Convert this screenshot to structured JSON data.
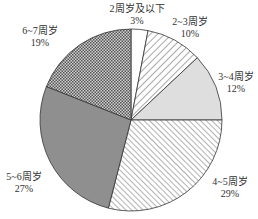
{
  "chart_data": {
    "type": "pie",
    "title": "",
    "start_angle": "12 o'clock",
    "direction": "clockwise",
    "categories": [
      "2周岁及以下",
      "2~3周岁",
      "3~4周岁",
      "4~5周岁",
      "5~6周岁",
      "6~7周岁"
    ],
    "values": [
      3,
      10,
      12,
      29,
      27,
      19
    ],
    "unit": "%",
    "slices": [
      {
        "label": "2周岁及以下",
        "value": 3,
        "value_label": "3%",
        "fill": "white",
        "color": "#ffffff"
      },
      {
        "label": "2~3周岁",
        "value": 10,
        "value_label": "10%",
        "fill": "diagonal-hatch",
        "color": "#ffffff"
      },
      {
        "label": "3~4周岁",
        "value": 12,
        "value_label": "12%",
        "fill": "light-gray",
        "color": "#dcdcdc"
      },
      {
        "label": "4~5周岁",
        "value": 29,
        "value_label": "29%",
        "fill": "back-diagonal-hatch",
        "color": "#ffffff"
      },
      {
        "label": "5~6周岁",
        "value": 27,
        "value_label": "27%",
        "fill": "dark-gray",
        "color": "#8e8e8e"
      },
      {
        "label": "6~7周岁",
        "value": 19,
        "value_label": "19%",
        "fill": "checker",
        "color": "#9a9a9a"
      }
    ],
    "legend": "none (labels placed outside slices)"
  },
  "labels": [
    {
      "name": "2周岁及以下",
      "pct": "3%"
    },
    {
      "name": "2~3周岁",
      "pct": "10%"
    },
    {
      "name": "3~4周岁",
      "pct": "12%"
    },
    {
      "name": "4~5周岁",
      "pct": "29%"
    },
    {
      "name": "5~6周岁",
      "pct": "27%"
    },
    {
      "name": "6~7周岁",
      "pct": "19%"
    }
  ]
}
